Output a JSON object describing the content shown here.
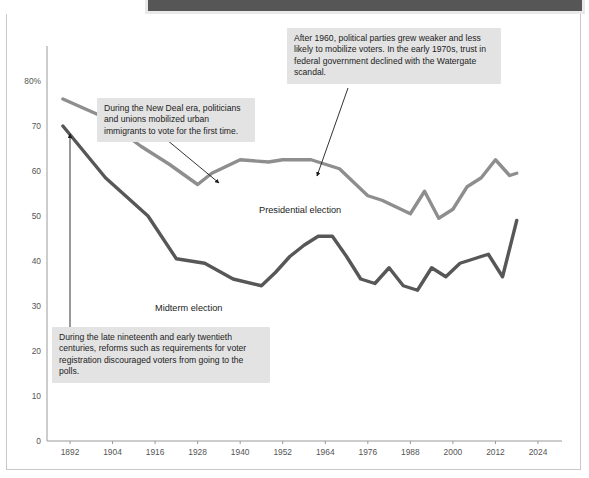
{
  "figure": {
    "background_color": "#ffffff",
    "banner_color": "#565656",
    "note_box_color": "#e3e3e3",
    "axis_color": "#9a9a9a",
    "tick_text_color": "#555555"
  },
  "annotations": [
    {
      "id": "watergate",
      "text": "After 1960, political parties grew weaker and less likely to mobilize voters. In the early 1970s, trust in federal government declined with the Watergate scandal.",
      "leader_from": [
        348,
        88
      ],
      "leader_to": [
        317,
        176
      ]
    },
    {
      "id": "new-deal",
      "text": "During the New Deal era, politicians and unions mobilized urban immigrants to vote for the first time.",
      "leader_from": [
        167,
        140
      ],
      "leader_to": [
        219,
        183
      ]
    },
    {
      "id": "reforms",
      "text": "During the late nineteenth and early twentieth centuries, reforms such as requirements for voter registration discouraged voters from going to the polls.",
      "leader_from": [
        70,
        327
      ],
      "leader_to": [
        70,
        134
      ]
    }
  ],
  "chart_data": {
    "type": "line",
    "title": "",
    "xlabel": "",
    "ylabel": "",
    "xlim": [
      1890,
      2024
    ],
    "ylim": [
      0,
      80
    ],
    "grid": false,
    "legend_position": "inline-labels",
    "y_ticks": [
      "80%",
      "70",
      "60",
      "50",
      "40",
      "30",
      "20",
      "10",
      "0"
    ],
    "y_tick_values": [
      80,
      70,
      60,
      50,
      40,
      30,
      20,
      10,
      0
    ],
    "x_ticks": [
      "1892",
      "1904",
      "1916",
      "1928",
      "1940",
      "1952",
      "1964",
      "1976",
      "1988",
      "2000",
      "2012",
      "2024"
    ],
    "x_tick_values": [
      1892,
      1904,
      1916,
      1928,
      1940,
      1952,
      1964,
      1976,
      1988,
      2000,
      2012,
      2024
    ],
    "series": [
      {
        "name": "Presidential election",
        "color": "#8e8e8e",
        "x": [
          1890,
          1900,
          1912,
          1920,
          1928,
          1932,
          1940,
          1948,
          1952,
          1960,
          1964,
          1968,
          1976,
          1980,
          1988,
          1992,
          1996,
          2000,
          2004,
          2008,
          2012,
          2016,
          2018
        ],
        "y": [
          76.0,
          72.5,
          65.5,
          61.5,
          57.0,
          59.5,
          62.5,
          62.0,
          62.5,
          62.5,
          61.5,
          60.5,
          54.5,
          53.5,
          50.5,
          55.5,
          49.5,
          51.5,
          56.5,
          58.5,
          62.5,
          59.0,
          59.5
        ]
      },
      {
        "name": "Midterm election",
        "color": "#575757",
        "x": [
          1890,
          1902,
          1914,
          1922,
          1930,
          1938,
          1946,
          1950,
          1954,
          1958,
          1962,
          1966,
          1970,
          1974,
          1978,
          1982,
          1986,
          1990,
          1994,
          1998,
          2002,
          2006,
          2010,
          2014,
          2018
        ],
        "y": [
          70.0,
          58.5,
          50.0,
          40.5,
          39.5,
          36.0,
          34.5,
          37.5,
          41.0,
          43.5,
          45.5,
          45.5,
          41.0,
          36.0,
          35.0,
          38.5,
          34.5,
          33.5,
          38.5,
          36.5,
          39.5,
          40.5,
          41.5,
          36.5,
          49.0
        ]
      }
    ]
  }
}
